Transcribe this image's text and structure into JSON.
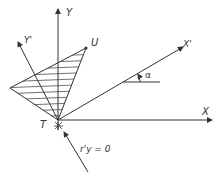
{
  "diagram": {
    "labels": {
      "y_axis": "Y",
      "y_prime_axis": "Y'",
      "x_axis": "X",
      "x_prime_axis": "X'",
      "point_u": "U",
      "point_t": "T",
      "angle": "α",
      "condition": "r'y = 0"
    },
    "colors": {
      "line": "#333333",
      "background": "#ffffff"
    }
  }
}
